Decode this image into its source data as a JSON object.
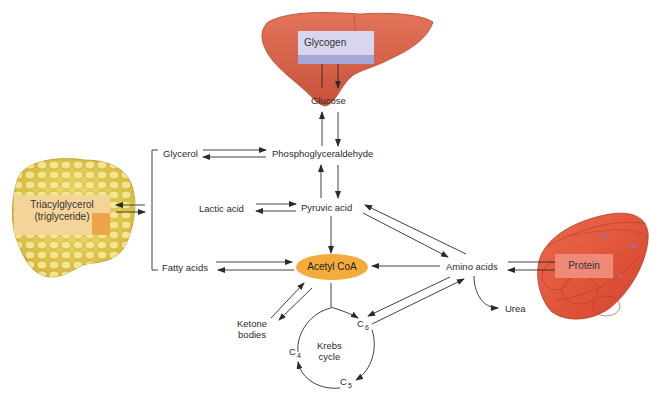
{
  "diagram": {
    "organs": {
      "liver": {
        "label": "Glycogen",
        "color": "#d9664a"
      },
      "adipose": {
        "label_line1": "Triacylglycerol",
        "label_line2": "(triglyceride)",
        "color": "#e8d15a"
      },
      "muscle": {
        "label": "Protein",
        "color": "#e8553c"
      }
    },
    "nodes": {
      "glucose": "Glucose",
      "glycerol": "Glycerol",
      "phosphoglyceraldehyde": "Phosphoglyceraldehyde",
      "lactic_acid": "Lactic acid",
      "pyruvic_acid": "Pyruvic acid",
      "fatty_acids": "Fatty acids",
      "acetyl_coa": "Acetyl CoA",
      "amino_acids": "Amino acids",
      "ketone_bodies_line1": "Ketone",
      "ketone_bodies_line2": "bodies",
      "krebs_line1": "Krebs",
      "krebs_line2": "cycle",
      "urea": "Urea",
      "c6": "C",
      "c6_sub": "6",
      "c5": "C",
      "c5_sub": "5",
      "c4": "C",
      "c4_sub": "4"
    },
    "colors": {
      "acetyl_coa_fill": "#f3ac3c",
      "glycogen_box": "#d8d6ee",
      "protein_box": "#f08a78",
      "triglyceride_box": "#f5d49a",
      "arrow": "#2b2b2b"
    },
    "connections": [
      {
        "from": "Glycogen",
        "to": "Glucose",
        "bidirectional": true
      },
      {
        "from": "Glucose",
        "to": "Phosphoglyceraldehyde",
        "bidirectional": true
      },
      {
        "from": "Glycerol",
        "to": "Phosphoglyceraldehyde",
        "bidirectional": true
      },
      {
        "from": "Phosphoglyceraldehyde",
        "to": "Pyruvic acid",
        "bidirectional": true
      },
      {
        "from": "Lactic acid",
        "to": "Pyruvic acid",
        "bidirectional": true
      },
      {
        "from": "Pyruvic acid",
        "to": "Acetyl CoA",
        "bidirectional": false
      },
      {
        "from": "Pyruvic acid",
        "to": "Amino acids",
        "bidirectional": true
      },
      {
        "from": "Fatty acids",
        "to": "Acetyl CoA",
        "bidirectional": true
      },
      {
        "from": "Amino acids",
        "to": "Acetyl CoA",
        "bidirectional": false
      },
      {
        "from": "Amino acids",
        "to": "Protein",
        "bidirectional": true
      },
      {
        "from": "Amino acids",
        "to": "Urea",
        "bidirectional": false
      },
      {
        "from": "Amino acids",
        "to": "C6",
        "bidirectional": true
      },
      {
        "from": "Acetyl CoA",
        "to": "Ketone bodies",
        "bidirectional": true
      },
      {
        "from": "Acetyl CoA",
        "to": "C6",
        "bidirectional": false
      },
      {
        "from": "Triacylglycerol",
        "to": "Glycerol/Fatty acids",
        "bidirectional": true
      },
      {
        "from": "C6",
        "to": "C5",
        "bidirectional": false
      },
      {
        "from": "C5",
        "to": "C4",
        "bidirectional": false
      }
    ]
  }
}
